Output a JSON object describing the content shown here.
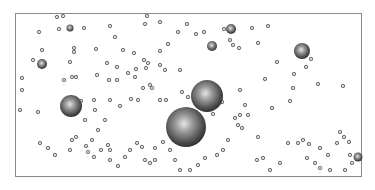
{
  "scene": {
    "description": "Spheres of varying sizes distributed in a rectangular box",
    "frame": {
      "x": 15,
      "y": 13,
      "width": 347,
      "height": 164,
      "stroke": "#8a8a8a"
    },
    "large_spheres": [
      {
        "cx": 186,
        "cy": 127,
        "r": 20
      },
      {
        "cx": 207,
        "cy": 96,
        "r": 16
      },
      {
        "cx": 71,
        "cy": 106,
        "r": 11
      },
      {
        "cx": 302,
        "cy": 51,
        "r": 8
      },
      {
        "cx": 42,
        "cy": 64,
        "r": 5
      },
      {
        "cx": 231,
        "cy": 29,
        "r": 5
      },
      {
        "cx": 212,
        "cy": 46,
        "r": 5
      },
      {
        "cx": 70,
        "cy": 28,
        "r": 3.5
      },
      {
        "cx": 358,
        "cy": 157,
        "r": 4.5
      }
    ],
    "small_spheres": [
      [
        57,
        17
      ],
      [
        63,
        16
      ],
      [
        39,
        32
      ],
      [
        59,
        29
      ],
      [
        84,
        28
      ],
      [
        110,
        26
      ],
      [
        145,
        24
      ],
      [
        147,
        16
      ],
      [
        160,
        22
      ],
      [
        178,
        32
      ],
      [
        187,
        24
      ],
      [
        42,
        50
      ],
      [
        74,
        48
      ],
      [
        74,
        52
      ],
      [
        96,
        49
      ],
      [
        115,
        37
      ],
      [
        123,
        50
      ],
      [
        134,
        53
      ],
      [
        144,
        60
      ],
      [
        160,
        51
      ],
      [
        168,
        44
      ],
      [
        33,
        60
      ],
      [
        70,
        62
      ],
      [
        107,
        63
      ],
      [
        117,
        67
      ],
      [
        128,
        73
      ],
      [
        136,
        69
      ],
      [
        146,
        68
      ],
      [
        148,
        63
      ],
      [
        160,
        65
      ],
      [
        165,
        70
      ],
      [
        180,
        70
      ],
      [
        22,
        78
      ],
      [
        64,
        80
      ],
      [
        72,
        77
      ],
      [
        76,
        77
      ],
      [
        97,
        75
      ],
      [
        109,
        80
      ],
      [
        117,
        80
      ],
      [
        135,
        77
      ],
      [
        143,
        88
      ],
      [
        150,
        85
      ],
      [
        152,
        88
      ],
      [
        22,
        90
      ],
      [
        94,
        100
      ],
      [
        110,
        100
      ],
      [
        120,
        106
      ],
      [
        131,
        99
      ],
      [
        138,
        100
      ],
      [
        160,
        100
      ],
      [
        166,
        100
      ],
      [
        182,
        92
      ],
      [
        188,
        97
      ],
      [
        196,
        34
      ],
      [
        204,
        32
      ],
      [
        224,
        29
      ],
      [
        230,
        40
      ],
      [
        233,
        45
      ],
      [
        239,
        48
      ],
      [
        252,
        28
      ],
      [
        268,
        26
      ],
      [
        258,
        43
      ],
      [
        277,
        62
      ],
      [
        265,
        79
      ],
      [
        311,
        59
      ],
      [
        306,
        67
      ],
      [
        294,
        74
      ],
      [
        318,
        84
      ],
      [
        293,
        88
      ],
      [
        343,
        86
      ],
      [
        240,
        90
      ],
      [
        245,
        105
      ],
      [
        20,
        110
      ],
      [
        38,
        112
      ],
      [
        81,
        101
      ],
      [
        85,
        120
      ],
      [
        95,
        110
      ],
      [
        105,
        120
      ],
      [
        98,
        130
      ],
      [
        92,
        140
      ],
      [
        108,
        145
      ],
      [
        110,
        150
      ],
      [
        40,
        143
      ],
      [
        48,
        148
      ],
      [
        55,
        155
      ],
      [
        70,
        150
      ],
      [
        72,
        140
      ],
      [
        76,
        137
      ],
      [
        86,
        146
      ],
      [
        88,
        152
      ],
      [
        94,
        157
      ],
      [
        101,
        150
      ],
      [
        110,
        160
      ],
      [
        118,
        166
      ],
      [
        125,
        157
      ],
      [
        130,
        150
      ],
      [
        137,
        143
      ],
      [
        142,
        147
      ],
      [
        145,
        160
      ],
      [
        150,
        163
      ],
      [
        155,
        160
      ],
      [
        222,
        102
      ],
      [
        213,
        114
      ],
      [
        235,
        118
      ],
      [
        240,
        115
      ],
      [
        248,
        115
      ],
      [
        242,
        128
      ],
      [
        238,
        125
      ],
      [
        228,
        140
      ],
      [
        223,
        150
      ],
      [
        217,
        155
      ],
      [
        205,
        158
      ],
      [
        198,
        165
      ],
      [
        190,
        170
      ],
      [
        180,
        170
      ],
      [
        175,
        160
      ],
      [
        170,
        150
      ],
      [
        163,
        142
      ],
      [
        155,
        148
      ],
      [
        258,
        137
      ],
      [
        272,
        108
      ],
      [
        290,
        101
      ],
      [
        303,
        140
      ],
      [
        288,
        143
      ],
      [
        298,
        143
      ],
      [
        309,
        144
      ],
      [
        307,
        158
      ],
      [
        315,
        163
      ],
      [
        320,
        148
      ],
      [
        328,
        155
      ],
      [
        340,
        132
      ],
      [
        344,
        137
      ],
      [
        337,
        143
      ],
      [
        349,
        142
      ],
      [
        350,
        155
      ],
      [
        352,
        163
      ],
      [
        257,
        160
      ],
      [
        263,
        158
      ],
      [
        270,
        170
      ],
      [
        280,
        163
      ],
      [
        320,
        168
      ],
      [
        330,
        170
      ],
      [
        345,
        170
      ]
    ],
    "sphere_color": "#6f6f6f"
  }
}
